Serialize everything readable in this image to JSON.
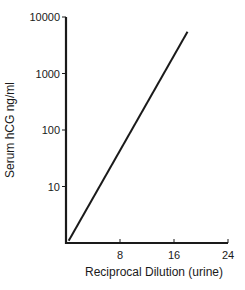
{
  "chart_data": {
    "type": "line",
    "title": "",
    "xlabel": "Reciprocal Dilution (urine)",
    "ylabel": "Serum hCG ng/ml",
    "xlim": [
      0,
      24
    ],
    "ylim": [
      1,
      10000
    ],
    "yscale": "log",
    "x_ticks": [
      8,
      16,
      24
    ],
    "x_tick_labels": [
      "8",
      "16",
      "24"
    ],
    "y_ticks": [
      10,
      100,
      1000,
      10000
    ],
    "y_tick_labels": [
      "10",
      "100",
      "1000",
      "10000"
    ],
    "grid": false,
    "legend": null,
    "series": [
      {
        "name": "hCG vs dilution",
        "x": [
          0.4,
          18
        ],
        "y": [
          1.1,
          5500
        ]
      }
    ]
  },
  "layout": {
    "plot_left": 66,
    "plot_right": 228,
    "plot_top": 17,
    "plot_bottom": 243,
    "line_color": "#1a1a1a"
  }
}
